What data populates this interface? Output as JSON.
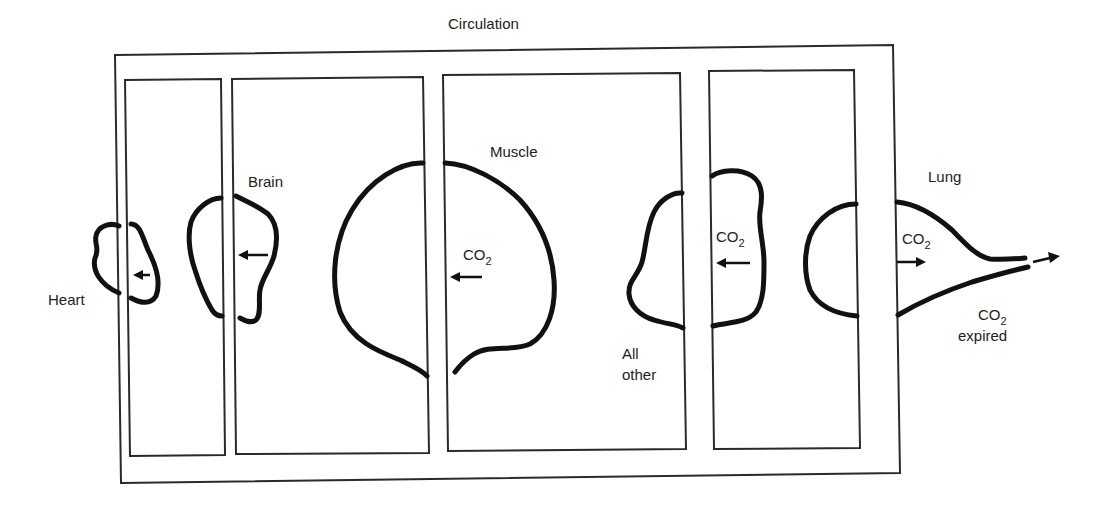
{
  "diagram": {
    "title": "Circulation",
    "compartments": [
      {
        "id": "heart",
        "label": "Heart",
        "flux_label": ""
      },
      {
        "id": "brain",
        "label": "Brain",
        "flux_label": ""
      },
      {
        "id": "muscle",
        "label": "Muscle",
        "flux_label": "CO",
        "flux_sub": "2"
      },
      {
        "id": "all-other",
        "label_line1": "All",
        "label_line2": "other",
        "flux_label": "CO",
        "flux_sub": "2"
      },
      {
        "id": "lung",
        "label": "Lung",
        "flux_label": "CO",
        "flux_sub": "2"
      }
    ],
    "output": {
      "label": "CO",
      "label_sub": "2",
      "label_line2": "expired"
    },
    "colors": {
      "stroke": "#111111",
      "frame": "#2a2a2a",
      "background": "#ffffff"
    }
  }
}
